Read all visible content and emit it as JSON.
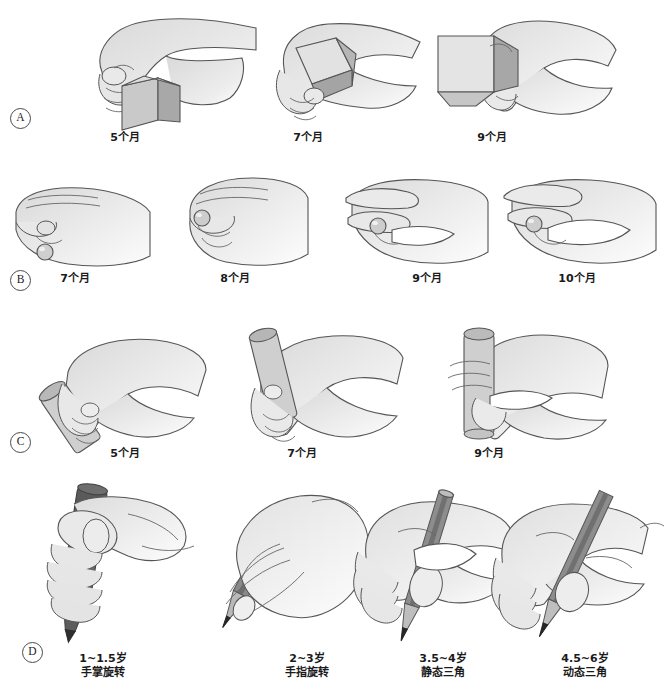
{
  "figure": {
    "background": "#ffffff",
    "style": "grayscale-line-art"
  },
  "colors": {
    "skin_fill": "#e3e3e3",
    "skin_shade": "#cfcfcf",
    "outline": "#555555",
    "object_light": "#dcdcdc",
    "object_mid": "#c2c2c2",
    "object_dark": "#9d9d9d",
    "pencil_body": "#8f8f8f",
    "pencil_dark": "#5d5d5d",
    "marker_dark": "#5a5a5a",
    "tip_black": "#2b2b2b",
    "text": "#1a1a1a"
  },
  "rows": [
    {
      "marker": "A",
      "marker_name": "panel-marker-a",
      "object": "cube",
      "panels": [
        {
          "label": "5个月",
          "grasp": "尺侧掌抓握"
        },
        {
          "label": "7个月",
          "grasp": "桡侧掌抓握"
        },
        {
          "label": "9个月",
          "grasp": "桡侧指抓握"
        }
      ]
    },
    {
      "marker": "B",
      "marker_name": "panel-marker-b",
      "object": "pellet",
      "panels": [
        {
          "label": "7个月",
          "grasp": "耙状抓握"
        },
        {
          "label": "8个月",
          "grasp": "剪刀状抓握"
        },
        {
          "label": "9个月",
          "grasp": "下钳捏"
        },
        {
          "label": "10个月",
          "grasp": "钳捏"
        }
      ]
    },
    {
      "marker": "C",
      "marker_name": "panel-marker-c",
      "object": "cylinder",
      "panels": [
        {
          "label": "5个月",
          "grasp": "尺侧掌握"
        },
        {
          "label": "7个月",
          "grasp": "掌握"
        },
        {
          "label": "9个月",
          "grasp": "桡侧指握"
        }
      ]
    },
    {
      "marker": "D",
      "marker_name": "panel-marker-d",
      "object": "pencil",
      "panels": [
        {
          "label": "1~1.5岁",
          "label2": "手掌旋转"
        },
        {
          "label": "2~3岁",
          "label2": "手指旋转"
        },
        {
          "label": "3.5~4岁",
          "label2": "静态三角"
        },
        {
          "label": "4.5~6岁",
          "label2": "动态三角"
        }
      ]
    }
  ]
}
